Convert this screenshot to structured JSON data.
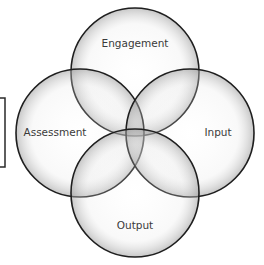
{
  "diagram": {
    "type": "four-circle-venn",
    "circles": [
      {
        "id": "engagement",
        "label": "Engagement",
        "cx": 135,
        "cy": 72,
        "r": 64,
        "label_x": 135,
        "label_y": 47
      },
      {
        "id": "assessment",
        "label": "Assessment",
        "cx": 80,
        "cy": 133,
        "r": 64,
        "label_x": 55,
        "label_y": 136
      },
      {
        "id": "input",
        "label": "Input",
        "cx": 190,
        "cy": 133,
        "r": 64,
        "label_x": 218,
        "label_y": 136
      },
      {
        "id": "output",
        "label": "Output",
        "cx": 135,
        "cy": 193,
        "r": 64,
        "label_x": 135,
        "label_y": 229
      }
    ],
    "bracket": {
      "x": 5,
      "y_top": 98,
      "y_bottom": 167,
      "arm": 5
    },
    "colors": {
      "stroke": "#1e1e1e",
      "fill_light": "#f7f7f7",
      "fill_dark": "#c9c9c9",
      "label": "#3a3a3a"
    }
  }
}
